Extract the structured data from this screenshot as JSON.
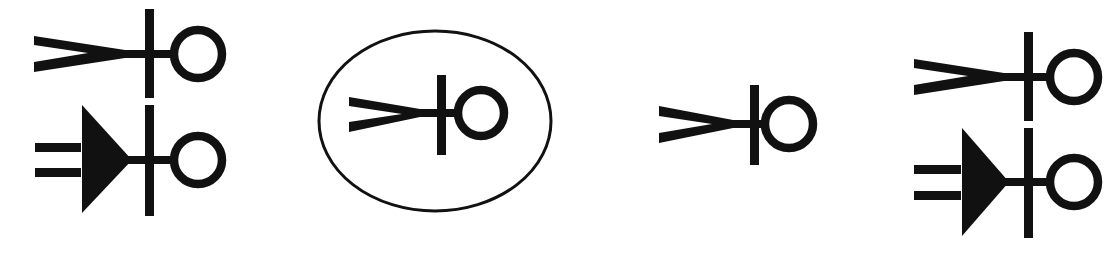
{
  "diagram": {
    "title": "",
    "colors": {
      "ink": "#111111",
      "background": "#ffffff"
    },
    "groups": [
      {
        "name": "group-1",
        "symbols": [
          {
            "type": "receptacle-fork",
            "label": ""
          },
          {
            "type": "plug-triangle-with-double-line",
            "label": ""
          }
        ]
      },
      {
        "name": "group-2",
        "enclosure": "ellipse",
        "symbols": [
          {
            "type": "receptacle-fork",
            "label": ""
          }
        ]
      },
      {
        "name": "group-3",
        "symbols": [
          {
            "type": "receptacle-fork",
            "label": ""
          }
        ]
      },
      {
        "name": "group-4",
        "symbols": [
          {
            "type": "receptacle-fork",
            "label": ""
          },
          {
            "type": "plug-triangle-with-double-line",
            "label": ""
          }
        ]
      }
    ]
  }
}
